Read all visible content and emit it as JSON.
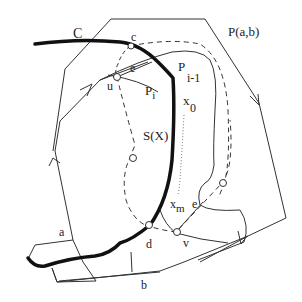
{
  "diagram": {
    "labels": {
      "C": "C",
      "c": "c",
      "e_top": "e",
      "u": "u",
      "P_i": "P",
      "P_i_sub": "i",
      "P_i1": "P",
      "P_i1_sub": "i-1",
      "x0": "x",
      "x0_sub": "0",
      "SX": "S(X)",
      "Pab": "P(a,b)",
      "xm": "x",
      "xm_sub": "m",
      "e_bottom": "e",
      "d": "d",
      "v": "v",
      "a": "a",
      "b": "b"
    },
    "colors": {
      "stroke": "#333333",
      "thick_curve": "#111111",
      "background": "#ffffff"
    }
  }
}
